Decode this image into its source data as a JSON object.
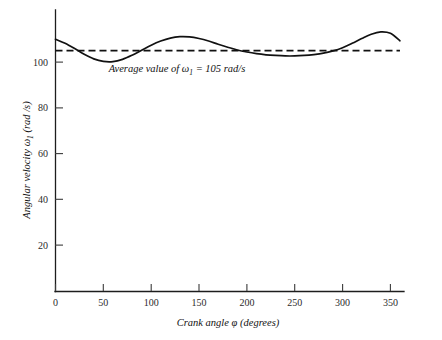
{
  "chart_data": {
    "type": "line",
    "title": "",
    "xlabel": "Crank angle φ (degrees)",
    "ylabel": "Angular velocity ω₁ (rad /s)",
    "xlabel_parts": {
      "pre": "Crank angle ",
      "symbol": "φ",
      "post": " (degrees)"
    },
    "ylabel_parts": {
      "pre": "Angular velocity ",
      "symbol": "ω",
      "subscript": "1",
      "post": " (rad /s)"
    },
    "xlim": [
      0,
      368
    ],
    "ylim": [
      0,
      118
    ],
    "xticks": [
      0,
      50,
      100,
      150,
      200,
      250,
      300,
      350
    ],
    "yticks": [
      20,
      40,
      60,
      80,
      100
    ],
    "xtick_labels": [
      "0",
      "50",
      "100",
      "150",
      "200",
      "250",
      "300",
      "350"
    ],
    "ytick_labels": [
      "20",
      "40",
      "60",
      "80",
      "100"
    ],
    "grid": false,
    "legend": "none",
    "series": [
      {
        "name": "Angular velocity ω₁",
        "style": "solid",
        "color": "#111111",
        "x": [
          0,
          10,
          20,
          30,
          40,
          50,
          60,
          70,
          80,
          90,
          100,
          110,
          120,
          130,
          140,
          150,
          160,
          170,
          180,
          190,
          200,
          210,
          220,
          230,
          240,
          250,
          260,
          270,
          280,
          290,
          300,
          310,
          320,
          330,
          340,
          350,
          360
        ],
        "y": [
          110.0,
          108.2,
          105.9,
          103.4,
          101.4,
          100.3,
          100.2,
          101.2,
          103.0,
          105.2,
          107.4,
          109.2,
          110.5,
          111.1,
          111.0,
          110.3,
          109.2,
          107.8,
          106.5,
          105.3,
          104.4,
          103.7,
          103.2,
          102.9,
          102.7,
          102.7,
          102.9,
          103.3,
          103.9,
          104.9,
          106.3,
          108.2,
          110.3,
          112.2,
          113.2,
          112.6,
          109.3
        ]
      }
    ],
    "reference_lines": [
      {
        "name": "average-value",
        "orientation": "horizontal",
        "value": 105,
        "style": "dashed",
        "color": "#111111",
        "label": "Average value of ω₁ = 105 rad/s",
        "label_parts": {
          "pre": "Average value of ",
          "symbol": "ω",
          "subscript": "1",
          "post": " = 105 rad/s"
        }
      }
    ],
    "annotations": [
      {
        "name": "average-value-annotation",
        "text": "Average value of ω₁ = 105 rad/s",
        "x": 130,
        "y": 99
      }
    ]
  }
}
